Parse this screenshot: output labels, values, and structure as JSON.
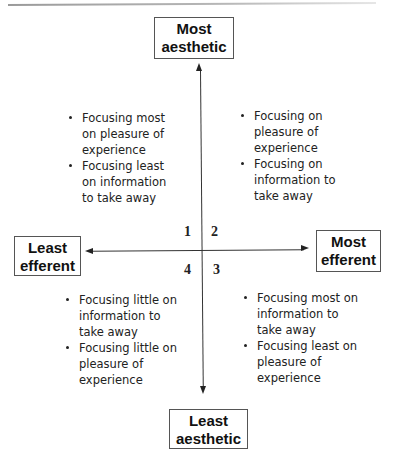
{
  "diagram": {
    "axes": {
      "top": {
        "line1": "Most",
        "line2": "aesthetic"
      },
      "bottom": {
        "line1": "Least",
        "line2": "aesthetic"
      },
      "left": {
        "line1": "Least",
        "line2": "efferent"
      },
      "right": {
        "line1": "Most",
        "line2": "efferent"
      }
    },
    "quadrants": [
      {
        "number": "1",
        "bullets": [
          [
            "Focusing most",
            "on pleasure of",
            "experience"
          ],
          [
            "Focusing least",
            "on information",
            "to take away"
          ]
        ]
      },
      {
        "number": "2",
        "bullets": [
          [
            "Focusing on",
            "pleasure of",
            "experience"
          ],
          [
            "Focusing on",
            "information to",
            "take away"
          ]
        ]
      },
      {
        "number": "3",
        "bullets": [
          [
            "Focusing most on",
            "information to",
            "take away"
          ],
          [
            "Focusing least on",
            "pleasure of",
            "experience"
          ]
        ]
      },
      {
        "number": "4",
        "bullets": [
          [
            "Focusing little on",
            "information to",
            "take away"
          ],
          [
            "Focusing little on",
            "pleasure of",
            "experience"
          ]
        ]
      }
    ]
  }
}
